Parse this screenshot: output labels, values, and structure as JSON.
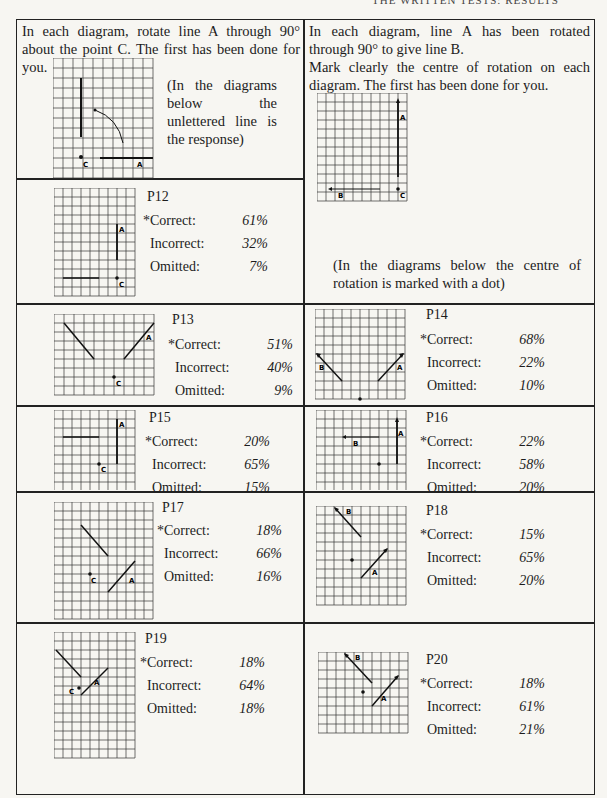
{
  "page_header": "THE WRITTEN TESTS: RESULTS",
  "left_instruction": "In each diagram, rotate line A through 90° about the point C. The first has been done for you.",
  "left_note": "(In the diagrams below the unlettered line is the response)",
  "right_instruction_1": "In each diagram, line A has been rotated through 90° to give line B.",
  "right_instruction_2": "Mark clearly the centre of rotation on each diagram. The first has been done for you.",
  "right_note": "(In the diagrams below the centre of rotation is marked with a dot)",
  "labels": {
    "correct": "*Correct:",
    "incorrect": "Incorrect:",
    "omitted": "Omitted:"
  },
  "items": {
    "p12": {
      "title": "P12",
      "correct": "61%",
      "incorrect": "32%",
      "omitted": "7%"
    },
    "p13": {
      "title": "P13",
      "correct": "51%",
      "incorrect": "40%",
      "omitted": "9%"
    },
    "p14": {
      "title": "P14",
      "correct": "68%",
      "incorrect": "22%",
      "omitted": "10%"
    },
    "p15": {
      "title": "P15",
      "correct": "20%",
      "incorrect": "65%",
      "omitted": "15%"
    },
    "p16": {
      "title": "P16",
      "correct": "22%",
      "incorrect": "58%",
      "omitted": "20%"
    },
    "p17": {
      "title": "P17",
      "correct": "18%",
      "incorrect": "66%",
      "omitted": "16%"
    },
    "p18": {
      "title": "P18",
      "correct": "15%",
      "incorrect": "65%",
      "omitted": "20%"
    },
    "p19": {
      "title": "P19",
      "correct": "18%",
      "incorrect": "64%",
      "omitted": "18%"
    },
    "p20": {
      "title": "P20",
      "correct": "18%",
      "incorrect": "61%",
      "omitted": "21%"
    }
  },
  "diagram_labels": {
    "a": "A",
    "b": "B",
    "c": "C"
  }
}
